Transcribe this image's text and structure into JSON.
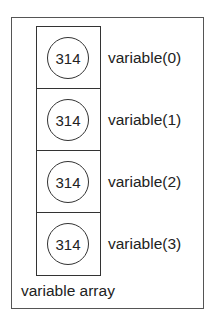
{
  "diagram": {
    "caption": "variable array",
    "elements": [
      {
        "value": "314",
        "label": "variable(0)"
      },
      {
        "value": "314",
        "label": "variable(1)"
      },
      {
        "value": "314",
        "label": "variable(2)"
      },
      {
        "value": "314",
        "label": "variable(3)"
      }
    ]
  }
}
